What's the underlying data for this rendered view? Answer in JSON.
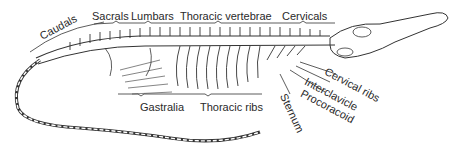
{
  "diagram": {
    "labels": {
      "caudals": "Caudals",
      "sacrals": "Sacrals",
      "lumbars": "Lumbars",
      "thoracic_vertebrae": "Thoracic vertebrae",
      "cervicals": "Cervicals",
      "cervical_ribs": "Cervical ribs",
      "interclavicle": "Interclavicle",
      "procoracoid": "Procoracoid",
      "sternum": "Sternum",
      "gastralia": "Gastralia",
      "thoracic_ribs": "Thoracic ribs"
    },
    "colors": {
      "line": "#333333",
      "background": "#ffffff"
    }
  }
}
